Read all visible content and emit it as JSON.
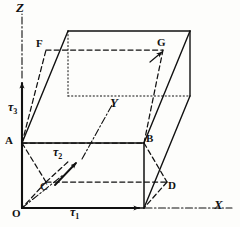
{
  "figure": {
    "stroke_color": "#111111",
    "background_color": "#fdfdfb"
  },
  "axes": [
    {
      "id": "x",
      "label": "X",
      "style": "dash-dot",
      "x": 214,
      "y": 201
    },
    {
      "id": "y",
      "label": "Y",
      "style": "dash-dot",
      "x": 110,
      "y": 98
    },
    {
      "id": "z",
      "label": "Z",
      "style": "dash-dot",
      "x": 16,
      "y": 2
    }
  ],
  "vectors": [
    {
      "id": "tau1",
      "symbol": "τ",
      "subscript": "1",
      "axis": "x",
      "x": 70,
      "y": 207
    },
    {
      "id": "tau2",
      "symbol": "τ",
      "subscript": "2",
      "axis": "y",
      "x": 54,
      "y": 148
    },
    {
      "id": "tau3",
      "symbol": "τ",
      "subscript": "3",
      "axis": "z",
      "x": 8,
      "y": 102
    }
  ],
  "vertices": [
    {
      "id": "O",
      "label": "O",
      "x": 13,
      "y": 208
    },
    {
      "id": "A",
      "label": "A",
      "x": 6,
      "y": 135
    },
    {
      "id": "B",
      "label": "B",
      "x": 146,
      "y": 133
    },
    {
      "id": "C",
      "label": "C",
      "x": 39,
      "y": 183
    },
    {
      "id": "D",
      "label": "D",
      "x": 167,
      "y": 182
    },
    {
      "id": "F",
      "label": "F",
      "x": 36,
      "y": 39
    },
    {
      "id": "G",
      "label": "G",
      "x": 158,
      "y": 38
    }
  ]
}
